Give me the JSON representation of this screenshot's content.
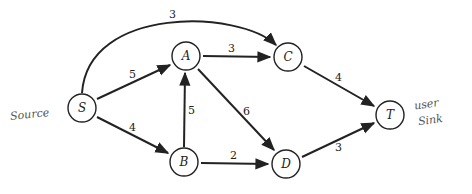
{
  "diagram": {
    "type": "directed weighted graph (flow network)",
    "nodes": [
      {
        "id": "S",
        "label": "S",
        "x": 82,
        "y": 108
      },
      {
        "id": "A",
        "label": "A",
        "x": 186,
        "y": 56
      },
      {
        "id": "B",
        "label": "B",
        "x": 184,
        "y": 162
      },
      {
        "id": "C",
        "label": "C",
        "x": 288,
        "y": 57
      },
      {
        "id": "D",
        "label": "D",
        "x": 286,
        "y": 164
      },
      {
        "id": "T",
        "label": "T",
        "x": 390,
        "y": 115
      }
    ],
    "edges": [
      {
        "from": "S",
        "to": "C",
        "weight": "3",
        "curved": true
      },
      {
        "from": "S",
        "to": "A",
        "weight": "5"
      },
      {
        "from": "S",
        "to": "B",
        "weight": "4"
      },
      {
        "from": "B",
        "to": "A",
        "weight": "5"
      },
      {
        "from": "A",
        "to": "C",
        "weight": "3"
      },
      {
        "from": "A",
        "to": "D",
        "weight": "6"
      },
      {
        "from": "B",
        "to": "D",
        "weight": "2"
      },
      {
        "from": "C",
        "to": "T",
        "weight": "4"
      },
      {
        "from": "D",
        "to": "T",
        "weight": "3"
      }
    ],
    "annotations": {
      "source_note": "Source",
      "sink_note_line1": "user",
      "sink_note_line2": "Sink"
    }
  }
}
